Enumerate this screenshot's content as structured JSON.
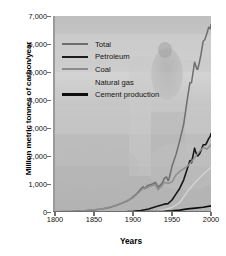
{
  "chart_data": {
    "type": "line",
    "title": "",
    "xlabel": "Years",
    "ylabel": "Million metric tonnes of carbon/year",
    "xlim": [
      1800,
      2000
    ],
    "ylim": [
      0,
      7000
    ],
    "xticks": [
      "1800",
      "1850",
      "1900",
      "1950",
      "2000"
    ],
    "yticks": [
      "0",
      "1,000",
      "2,000",
      "3,000",
      "4,000",
      "5,000",
      "6,000",
      "7,000"
    ],
    "grid": false,
    "legend_position": "upper-left",
    "legend": [
      "Total",
      "Petroleum",
      "Coal",
      "Natural gas",
      "Cement production"
    ],
    "series": [
      {
        "name": "Total",
        "color": "#6e6e6e",
        "width": 1.5,
        "x": [
          1800,
          1810,
          1820,
          1830,
          1840,
          1850,
          1860,
          1870,
          1880,
          1890,
          1895,
          1900,
          1905,
          1910,
          1913,
          1915,
          1918,
          1920,
          1925,
          1929,
          1932,
          1935,
          1938,
          1940,
          1943,
          1945,
          1946,
          1950,
          1955,
          1960,
          1965,
          1970,
          1973,
          1975,
          1979,
          1980,
          1982,
          1983,
          1985,
          1987,
          1990,
          1992,
          1995,
          1997,
          1999,
          2000
        ],
        "y": [
          8,
          14,
          20,
          32,
          50,
          75,
          110,
          160,
          250,
          360,
          430,
          540,
          660,
          820,
          900,
          830,
          930,
          960,
          1000,
          1060,
          880,
          960,
          1060,
          1200,
          1250,
          1120,
          1160,
          1630,
          2040,
          2560,
          3140,
          4090,
          4620,
          4620,
          5350,
          5270,
          5100,
          5100,
          5330,
          5600,
          6100,
          6150,
          6400,
          6600,
          6550,
          6700
        ]
      },
      {
        "name": "Petroleum",
        "color": "#171717",
        "width": 1.6,
        "x": [
          1870,
          1880,
          1890,
          1900,
          1910,
          1920,
          1930,
          1940,
          1945,
          1950,
          1955,
          1960,
          1965,
          1970,
          1973,
          1975,
          1979,
          1980,
          1982,
          1983,
          1985,
          1987,
          1990,
          1993,
          1995,
          1997,
          1999,
          2000
        ],
        "y": [
          1,
          4,
          10,
          22,
          55,
          110,
          200,
          280,
          300,
          430,
          640,
          850,
          1150,
          1580,
          1840,
          1760,
          2280,
          2180,
          2030,
          2000,
          2060,
          2180,
          2400,
          2400,
          2500,
          2620,
          2700,
          2800
        ]
      },
      {
        "name": "Coal",
        "color": "#8e8e8e",
        "width": 1.5,
        "x": [
          1800,
          1820,
          1840,
          1860,
          1880,
          1900,
          1913,
          1918,
          1920,
          1929,
          1932,
          1938,
          1940,
          1945,
          1950,
          1955,
          1960,
          1965,
          1970,
          1975,
          1980,
          1985,
          1990,
          1995,
          2000
        ],
        "y": [
          8,
          20,
          50,
          105,
          240,
          510,
          840,
          860,
          900,
          980,
          800,
          960,
          1060,
          1020,
          1070,
          1320,
          1450,
          1540,
          1640,
          1800,
          1980,
          2150,
          2300,
          2250,
          2400
        ]
      },
      {
        "name": "Natural gas",
        "color": "#d3d3d3",
        "width": 1.4,
        "x": [
          1900,
          1920,
          1930,
          1940,
          1950,
          1960,
          1970,
          1980,
          1990,
          2000
        ],
        "y": [
          2,
          20,
          45,
          80,
          160,
          340,
          740,
          1070,
          1350,
          1600
        ]
      },
      {
        "name": "Cement production",
        "color": "#0d0d0d",
        "width": 1.7,
        "x": [
          1900,
          1920,
          1940,
          1950,
          1960,
          1970,
          1980,
          1990,
          2000
        ],
        "y": [
          3,
          12,
          25,
          40,
          70,
          110,
          140,
          170,
          220
        ]
      }
    ]
  },
  "legend_items": [
    {
      "label": "Total",
      "color": "#6e6e6e",
      "thickness": "2px"
    },
    {
      "label": "Petroleum",
      "color": "#1c1c1c",
      "thickness": "2.6px"
    },
    {
      "label": "Coal",
      "color": "#8b8b8b",
      "thickness": "2px"
    },
    {
      "label": "Natural gas",
      "color": "#cfcfcf",
      "thickness": "1.6px"
    },
    {
      "label": "Cement production",
      "color": "#0d0d0d",
      "thickness": "2.6px"
    }
  ]
}
